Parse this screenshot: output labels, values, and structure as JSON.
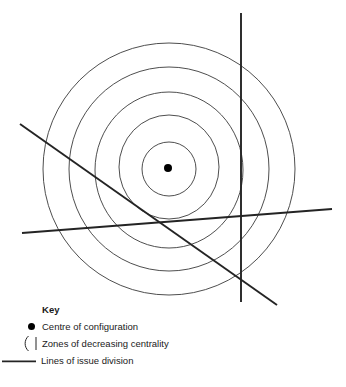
{
  "figure": {
    "background_color": "#ffffff",
    "ink_color": "#242424",
    "ring_color": "#3a3a3a"
  },
  "chart_data": {
    "type": "diagram",
    "title": "",
    "centre": {
      "cx": 168,
      "cy": 168,
      "r": 4,
      "label": "Centre of configuration"
    },
    "zones": [
      {
        "index": 1,
        "rx": 27,
        "ry": 27,
        "centrality": "highest"
      },
      {
        "index": 2,
        "rx": 50,
        "ry": 52,
        "centrality": "high"
      },
      {
        "index": 3,
        "rx": 74,
        "ry": 78,
        "centrality": "medium"
      },
      {
        "index": 4,
        "rx": 100,
        "ry": 102,
        "centrality": "low"
      },
      {
        "index": 5,
        "rx": 126,
        "ry": 126,
        "centrality": "lowest"
      }
    ],
    "lines": [
      {
        "name": "vertical-issue-line",
        "x1": 241,
        "y1": 13,
        "x2": 241,
        "y2": 302
      },
      {
        "name": "diagonal-issue-line",
        "x1": 20,
        "y1": 124,
        "x2": 277,
        "y2": 305
      },
      {
        "name": "horizontal-issue-line",
        "x1": 22,
        "y1": 233,
        "x2": 332,
        "y2": 209
      }
    ]
  },
  "key": {
    "title": "Key",
    "items": [
      {
        "icon": "filled-dot-icon",
        "label": "Centre of configuration"
      },
      {
        "icon": "arc-pair-icon",
        "label": "Zones of decreasing centrality"
      },
      {
        "icon": "straight-line-icon",
        "label": "Lines of issue division"
      }
    ]
  }
}
